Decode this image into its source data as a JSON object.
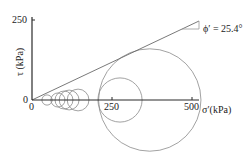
{
  "diagram": {
    "type": "mohr-coulomb-envelope",
    "y_axis": {
      "label": "τ (kPa)",
      "ticks": [
        {
          "value": 0,
          "label": "0"
        },
        {
          "value": 250,
          "label": "250"
        }
      ]
    },
    "x_axis": {
      "label": "σ′(kPa)",
      "ticks": [
        {
          "value": 0,
          "label": "0"
        },
        {
          "value": 250,
          "label": "250"
        },
        {
          "value": 500,
          "label": "500"
        }
      ]
    },
    "envelope": {
      "label": "ϕ′ = 25.4°",
      "friction_angle_deg": 25.4,
      "cohesion_kpa": 0
    },
    "mohr_circles_kpa": [
      {
        "center": 47,
        "radius": 16
      },
      {
        "center": 81,
        "radius": 22
      },
      {
        "center": 100,
        "radius": 28
      },
      {
        "center": 116,
        "radius": 31
      },
      {
        "center": 144,
        "radius": 34
      },
      {
        "center": 275,
        "radius": 69
      },
      {
        "center": 368,
        "radius": 160
      }
    ],
    "colors": {
      "axis": "#2a2a2a",
      "envelope": "#6a6a6a",
      "circle": "#8a8a8a"
    }
  }
}
